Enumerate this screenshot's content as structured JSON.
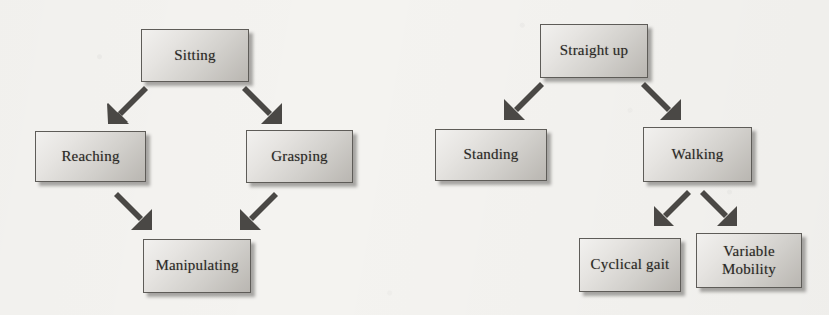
{
  "diagram": {
    "type": "flowchart",
    "background_color": "#f4f3f0",
    "node_fill_light": "#f2f1ef",
    "node_fill_dark": "#b9b6b1",
    "node_border_color": "#5e5c58",
    "text_color": "#2b2926",
    "arrow_color": "#4a4845",
    "groups": [
      {
        "id": "sitting-hierarchy",
        "name": "sitting-manipulation-hierarchy",
        "nodes": [
          {
            "id": "sitting",
            "label": "Sitting",
            "level": 0,
            "x": 141,
            "y": 29,
            "w": 108,
            "h": 53
          },
          {
            "id": "reaching",
            "label": "Reaching",
            "level": 1,
            "x": 35,
            "y": 131,
            "w": 111,
            "h": 51
          },
          {
            "id": "grasping",
            "label": "Grasping",
            "level": 1,
            "x": 246,
            "y": 130,
            "w": 107,
            "h": 53
          },
          {
            "id": "manipulating",
            "label": "Manipulating",
            "level": 2,
            "x": 143,
            "y": 239,
            "w": 108,
            "h": 54
          }
        ],
        "edges": [
          {
            "from": "sitting",
            "to": "reaching",
            "direction": "down-left"
          },
          {
            "from": "sitting",
            "to": "grasping",
            "direction": "down-right"
          },
          {
            "from": "reaching",
            "to": "manipulating",
            "direction": "down-right"
          },
          {
            "from": "grasping",
            "to": "manipulating",
            "direction": "down-left"
          }
        ]
      },
      {
        "id": "standing-hierarchy",
        "name": "standing-locomotion-hierarchy",
        "nodes": [
          {
            "id": "straight-up",
            "label": "Straight up",
            "level": 0,
            "x": 540,
            "y": 24,
            "w": 108,
            "h": 54
          },
          {
            "id": "standing",
            "label": "Standing",
            "level": 1,
            "x": 435,
            "y": 129,
            "w": 112,
            "h": 52
          },
          {
            "id": "walking",
            "label": "Walking",
            "level": 1,
            "x": 643,
            "y": 127,
            "w": 109,
            "h": 55
          },
          {
            "id": "cyclical-gait",
            "label": "Cyclical gait",
            "level": 2,
            "x": 579,
            "y": 238,
            "w": 102,
            "h": 54
          },
          {
            "id": "variable-mobility",
            "label": "Variable\nMobility",
            "level": 2,
            "x": 696,
            "y": 233,
            "w": 106,
            "h": 55
          }
        ],
        "edges": [
          {
            "from": "straight-up",
            "to": "standing",
            "direction": "down-left"
          },
          {
            "from": "straight-up",
            "to": "walking",
            "direction": "down-right"
          },
          {
            "from": "walking",
            "to": "cyclical-gait",
            "direction": "down-left"
          },
          {
            "from": "walking",
            "to": "variable-mobility",
            "direction": "down-right"
          }
        ]
      }
    ]
  },
  "labels": {
    "sitting": "Sitting",
    "reaching": "Reaching",
    "grasping": "Grasping",
    "manipulating": "Manipulating",
    "straight_up": "Straight up",
    "standing": "Standing",
    "walking": "Walking",
    "cyclical_gait": "Cyclical gait",
    "variable_line1": "Variable",
    "variable_line2": "Mobility"
  }
}
